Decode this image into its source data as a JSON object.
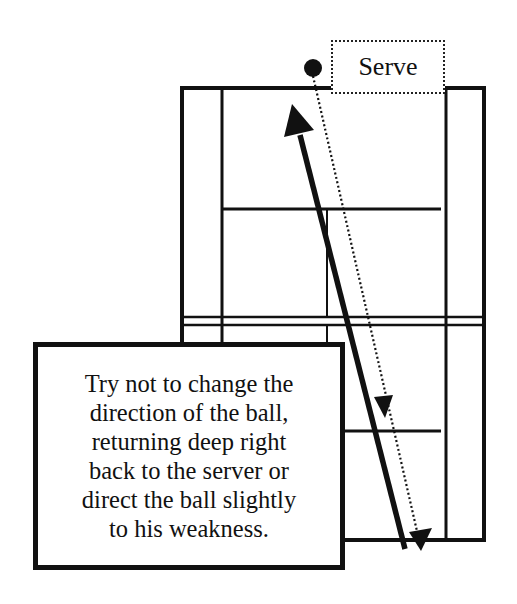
{
  "diagram": {
    "type": "badminton-court-shot-diagram",
    "serve_label": "Serve",
    "note": {
      "lines": [
        "Try not to change the",
        "direction of the ball,",
        "returning deep right",
        "back to the server or",
        "direct the ball slightly",
        "to his weakness."
      ]
    },
    "elements": {
      "shuttle": "ball-icon",
      "serve_path": "dotted-arrow",
      "return_path": "solid-arrow"
    },
    "colors": {
      "ink": "#111111",
      "background": "#ffffff"
    }
  }
}
